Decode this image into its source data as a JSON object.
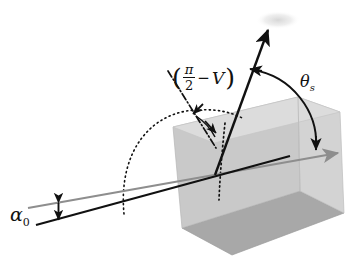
{
  "figure": {
    "labels": {
      "incidence_angle": "α",
      "incidence_angle_sub": "0",
      "scatter_angle": "θ",
      "scatter_angle_sub": "s",
      "view_expr_open": "(",
      "view_expr_num": "π",
      "view_expr_den": "2",
      "view_expr_minus": "−",
      "view_expr_var": "V",
      "view_expr_close": ")"
    },
    "colors": {
      "background": "#ffffff",
      "ink": "#111111",
      "ray_gray": "#8e8e8e",
      "box_top": "#dcdcdc",
      "box_front": "#c9c9c9",
      "box_bottom": "#a8a8a8",
      "box_right": "#d4d4d4",
      "box_edge": "#9a9a9a",
      "smudge": "#d8d8d8"
    },
    "elements": {
      "slab": "rectangular-slab",
      "horizon_ray": "gray-reference-ray-with-arrow",
      "incident_ray": "black-incident-ray",
      "scattered_ray": "black-scattered-arrow",
      "normal_line": "dash-dot-surface-normal",
      "vertical_line": "dotted-vertical-line",
      "big_arc": "dotted-hemisphere-arc",
      "theta_arc": "theta-s-angle-arc",
      "alpha_marker": "alpha-zero-double-arrow"
    }
  }
}
